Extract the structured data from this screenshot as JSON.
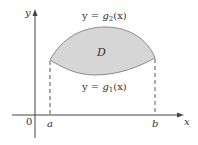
{
  "diagram": {
    "type": "region-between-curves",
    "region_label": "D",
    "upper_curve_label": {
      "prefix": "y = ",
      "func": "g",
      "sub": "2",
      "arg": "(x)"
    },
    "lower_curve_label": {
      "prefix": "y = ",
      "func": "g",
      "sub": "1",
      "arg": "(x)"
    },
    "axes": {
      "x_label": "x",
      "y_label": "y",
      "origin_label": "0"
    },
    "ticks": {
      "a": "a",
      "b": "b"
    },
    "colors": {
      "fill": "#d6d6d6",
      "stroke": "#8a8a8a",
      "axis": "#444444",
      "text": "#333333"
    }
  }
}
